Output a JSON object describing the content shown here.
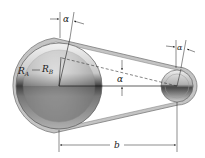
{
  "diagram": {
    "type": "belt-drive-pulleys",
    "labels": {
      "radius_outer": "R",
      "radius_outer_sub": "A",
      "radius_inner": "R",
      "radius_inner_sub": "B",
      "angle_top": "α",
      "angle_right": "α",
      "angle_center": "α",
      "center_distance": "b"
    },
    "colors": {
      "belt": "#b8b8b8",
      "belt_edge": "#7a7a7a",
      "pulley_light": "#e8e8e8",
      "pulley_dark": "#4a4a4a",
      "lines": "#1a1a1a"
    },
    "geometry": {
      "large_pulley_center": [
        59,
        86
      ],
      "large_pulley_radius": 43,
      "small_pulley_center": [
        177,
        86
      ],
      "small_pulley_radius": 17
    }
  }
}
